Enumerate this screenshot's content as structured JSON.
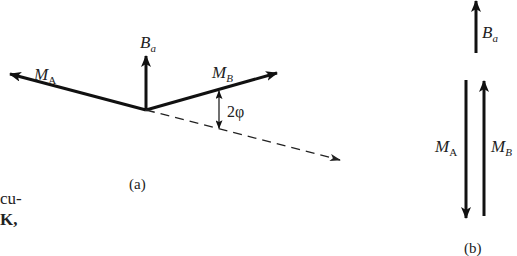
{
  "figure": {
    "panel_a": {
      "caption": "(a)",
      "vectors": {
        "M_A": {
          "label_main": "M",
          "label_sub": "A"
        },
        "B_a": {
          "label_main": "B",
          "label_sub": "a"
        },
        "M_B": {
          "label_main": "M",
          "label_sub": "B"
        }
      },
      "angle_label": "2φ"
    },
    "panel_b": {
      "caption": "(b)",
      "vectors": {
        "B_a": {
          "label_main": "B",
          "label_sub": "a"
        },
        "M_A": {
          "label_main": "M",
          "label_sub": "A"
        },
        "M_B": {
          "label_main": "M",
          "label_sub": "B"
        }
      }
    },
    "margin_text": {
      "line1": "cu-",
      "line2": "K,"
    }
  }
}
